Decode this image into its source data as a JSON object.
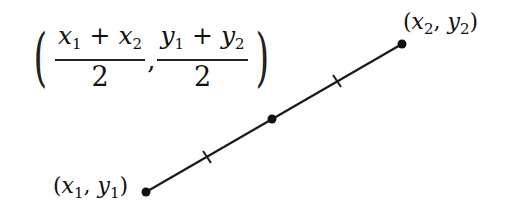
{
  "formula": {
    "open_paren": "(",
    "close_paren": ")",
    "x_fraction": {
      "numerator_a": "x",
      "sub_a": "1",
      "operator": " + ",
      "numerator_b": "x",
      "sub_b": "2",
      "denominator": "2"
    },
    "separator": ",",
    "y_fraction": {
      "numerator_a": "y",
      "sub_a": "1",
      "operator": " + ",
      "numerator_b": "y",
      "sub_b": "2",
      "denominator": "2"
    }
  },
  "point1_label": {
    "open": "(",
    "var_x": "x",
    "sub_x": "1",
    "sep": ", ",
    "var_y": "y",
    "sub_y": "1",
    "close": ")"
  },
  "point2_label": {
    "open": "(",
    "var_x": "x",
    "sub_x": "2",
    "sep": ", ",
    "var_y": "y",
    "sub_y": "2",
    "close": ")"
  },
  "colors": {
    "line": "#1a1a1a",
    "text": "#111111",
    "background": "#ffffff"
  }
}
